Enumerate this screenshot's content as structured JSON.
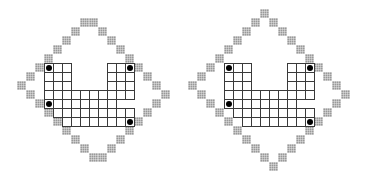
{
  "diagram": {
    "cell_size": 9,
    "colors": {
      "grid_line": "#3a3a3a",
      "border_fill": "#9a9a9a",
      "dot": "#000000",
      "background": "#ffffff"
    },
    "figures": [
      {
        "name": "left-figure",
        "origin": [
          44,
          63
        ],
        "grid_rows": [
          {
            "row": 0,
            "cols": [
              0,
              1,
              2,
              7,
              8,
              9
            ]
          },
          {
            "row": 1,
            "cols": [
              0,
              1,
              2,
              7,
              8,
              9
            ]
          },
          {
            "row": 2,
            "cols": [
              0,
              1,
              2,
              7,
              8,
              9
            ]
          },
          {
            "row": 3,
            "cols": [
              0,
              1,
              2,
              3,
              4,
              5,
              6,
              7,
              8,
              9
            ]
          },
          {
            "row": 4,
            "cols": [
              0,
              1,
              2,
              3,
              4,
              5,
              6,
              7
            ]
          },
          {
            "row": 5,
            "cols": [
              1,
              2,
              3,
              4,
              5,
              6,
              7,
              8,
              9
            ]
          },
          {
            "row": 6,
            "cols": [
              2,
              3,
              4,
              5,
              6,
              7,
              8,
              9
            ]
          }
        ],
        "border_cells": [
          [
            -5,
            4
          ],
          [
            -5,
            5
          ],
          [
            -4,
            3
          ],
          [
            -4,
            6
          ],
          [
            -3,
            2
          ],
          [
            -3,
            7
          ],
          [
            -2,
            1
          ],
          [
            -2,
            8
          ],
          [
            -1,
            0
          ],
          [
            -1,
            9
          ],
          [
            0,
            -1
          ],
          [
            0,
            10
          ],
          [
            1,
            -2
          ],
          [
            1,
            11
          ],
          [
            2,
            -3
          ],
          [
            2,
            12
          ],
          [
            3,
            -2
          ],
          [
            3,
            13
          ],
          [
            4,
            -1
          ],
          [
            4,
            12
          ],
          [
            5,
            0
          ],
          [
            5,
            11
          ],
          [
            6,
            1
          ],
          [
            6,
            10
          ],
          [
            7,
            2
          ],
          [
            7,
            9
          ],
          [
            8,
            3
          ],
          [
            8,
            8
          ],
          [
            9,
            4
          ],
          [
            9,
            7
          ],
          [
            10,
            5
          ],
          [
            10,
            6
          ]
        ],
        "dots": [
          [
            0,
            0
          ],
          [
            0,
            9
          ],
          [
            4,
            0
          ],
          [
            6,
            9
          ]
        ]
      },
      {
        "name": "right-figure",
        "origin": [
          224,
          63
        ],
        "grid_rows": [
          {
            "row": 0,
            "cols": [
              0,
              1,
              2,
              7,
              8,
              9
            ]
          },
          {
            "row": 1,
            "cols": [
              0,
              1,
              2,
              7,
              8,
              9
            ]
          },
          {
            "row": 2,
            "cols": [
              0,
              1,
              2,
              7,
              8,
              9
            ]
          },
          {
            "row": 3,
            "cols": [
              0,
              1,
              2,
              3,
              4,
              5,
              6,
              7,
              8,
              9
            ]
          },
          {
            "row": 4,
            "cols": [
              0,
              1,
              2,
              3,
              4,
              5,
              6,
              7
            ]
          },
          {
            "row": 5,
            "cols": [
              1,
              2,
              3,
              4,
              5,
              6,
              7,
              8,
              9
            ]
          },
          {
            "row": 6,
            "cols": [
              2,
              3,
              4,
              5,
              6,
              7,
              8,
              9
            ]
          }
        ],
        "border_cells": [
          [
            -6,
            4
          ],
          [
            -5,
            3
          ],
          [
            -5,
            5
          ],
          [
            -4,
            2
          ],
          [
            -4,
            6
          ],
          [
            -3,
            1
          ],
          [
            -3,
            7
          ],
          [
            -2,
            0
          ],
          [
            -2,
            8
          ],
          [
            -1,
            -1
          ],
          [
            -1,
            9
          ],
          [
            0,
            -2
          ],
          [
            0,
            10
          ],
          [
            1,
            -3
          ],
          [
            1,
            11
          ],
          [
            2,
            -4
          ],
          [
            2,
            12
          ],
          [
            3,
            -3
          ],
          [
            3,
            13
          ],
          [
            4,
            -2
          ],
          [
            4,
            12
          ],
          [
            5,
            -1
          ],
          [
            5,
            11
          ],
          [
            6,
            0
          ],
          [
            6,
            10
          ],
          [
            7,
            1
          ],
          [
            7,
            9
          ],
          [
            8,
            2
          ],
          [
            8,
            8
          ],
          [
            9,
            3
          ],
          [
            9,
            7
          ],
          [
            10,
            4
          ],
          [
            10,
            6
          ],
          [
            11,
            5
          ]
        ],
        "dots": [
          [
            0,
            0
          ],
          [
            0,
            9
          ],
          [
            4,
            0
          ],
          [
            6,
            9
          ]
        ]
      }
    ]
  }
}
